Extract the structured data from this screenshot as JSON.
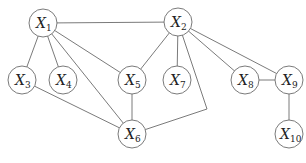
{
  "diagram": {
    "type": "undirected-graph",
    "node_radius": 14,
    "colors": {
      "stroke": "#6b6b6b",
      "text": "#222222",
      "background": "#ffffff"
    },
    "nodes": [
      {
        "id": "X1",
        "label": "X",
        "sub": "1",
        "x": 43,
        "y": 23
      },
      {
        "id": "X2",
        "label": "X",
        "sub": "2",
        "x": 178,
        "y": 22
      },
      {
        "id": "X3",
        "label": "X",
        "sub": "3",
        "x": 22,
        "y": 80
      },
      {
        "id": "X4",
        "label": "X",
        "sub": "4",
        "x": 63,
        "y": 80
      },
      {
        "id": "X5",
        "label": "X",
        "sub": "5",
        "x": 132,
        "y": 80
      },
      {
        "id": "X6",
        "label": "X",
        "sub": "6",
        "x": 132,
        "y": 134
      },
      {
        "id": "X7",
        "label": "X",
        "sub": "7",
        "x": 177,
        "y": 80
      },
      {
        "id": "X8",
        "label": "X",
        "sub": "8",
        "x": 245,
        "y": 80
      },
      {
        "id": "X9",
        "label": "X",
        "sub": "9",
        "x": 289,
        "y": 80
      },
      {
        "id": "X10",
        "label": "X",
        "sub": "10",
        "x": 289,
        "y": 134
      }
    ],
    "edges": [
      {
        "from": "X1",
        "to": "X2"
      },
      {
        "from": "X1",
        "to": "X3"
      },
      {
        "from": "X1",
        "to": "X4"
      },
      {
        "from": "X1",
        "to": "X5"
      },
      {
        "from": "X1",
        "to": "X6"
      },
      {
        "from": "X2",
        "to": "X5"
      },
      {
        "from": "X2",
        "to": "X7"
      },
      {
        "from": "X2",
        "to": "X8"
      },
      {
        "from": "X2",
        "to": "X9"
      },
      {
        "from": "X2",
        "to": "X6",
        "via": [
          [
            207,
            109
          ]
        ]
      },
      {
        "from": "X3",
        "to": "X6"
      },
      {
        "from": "X5",
        "to": "X6"
      },
      {
        "from": "X8",
        "to": "X9"
      },
      {
        "from": "X9",
        "to": "X10"
      }
    ]
  }
}
